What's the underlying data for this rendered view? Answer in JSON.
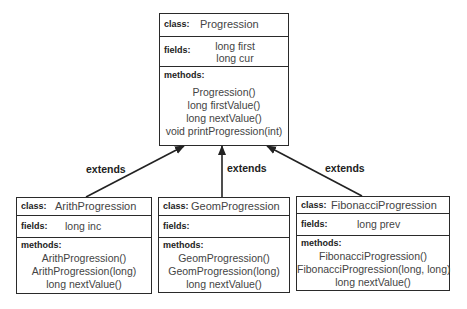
{
  "diagram": {
    "type": "UML class diagram",
    "section_labels": {
      "class": "class:",
      "fields": "fields:",
      "methods": "methods:"
    },
    "relationship_label": "extends",
    "classes": [
      {
        "name": "Progression",
        "role": "superclass",
        "fields": [
          "long first",
          "long cur"
        ],
        "methods": [
          "Progression()",
          "long firstValue()",
          "long nextValue()",
          "void printProgression(int)"
        ]
      },
      {
        "name": "ArithProgression",
        "role": "subclass",
        "fields": [
          "long inc"
        ],
        "methods": [
          "ArithProgression()",
          "ArithProgression(long)",
          "long nextValue()"
        ]
      },
      {
        "name": "GeomProgression",
        "role": "subclass",
        "fields": [],
        "methods": [
          "GeomProgression()",
          "GeomProgression(long)",
          "long nextValue()"
        ]
      },
      {
        "name": "FibonacciProgression",
        "role": "subclass",
        "fields": [
          "long prev"
        ],
        "methods": [
          "FibonacciProgression()",
          "FibonacciProgression(long, long)",
          "long nextValue()"
        ]
      }
    ],
    "edges": [
      {
        "from": "ArithProgression",
        "to": "Progression",
        "label": "extends"
      },
      {
        "from": "GeomProgression",
        "to": "Progression",
        "label": "extends"
      },
      {
        "from": "FibonacciProgression",
        "to": "Progression",
        "label": "extends"
      }
    ]
  }
}
